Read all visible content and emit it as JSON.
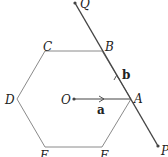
{
  "diagram": {
    "type": "regular hexagon with vectors",
    "colors": {
      "background": "#ffffff",
      "hexagon": "#8a8a8a",
      "line": "#444444",
      "text": "#222222"
    },
    "hexagon": {
      "vertices": [
        {
          "label": "A",
          "x": 131,
          "y": 99
        },
        {
          "label": "B",
          "x": 102,
          "y": 51
        },
        {
          "label": "C",
          "x": 45,
          "y": 51
        },
        {
          "label": "D",
          "x": 17,
          "y": 99
        },
        {
          "label": "E",
          "x": 45,
          "y": 147
        },
        {
          "label": "F",
          "x": 102,
          "y": 147
        }
      ]
    },
    "center": {
      "label": "O",
      "x": 74,
      "y": 99
    },
    "vectors": [
      {
        "label": "a",
        "from": "O",
        "to": "A"
      },
      {
        "label": "b",
        "from": "A",
        "to": "B",
        "along": "line PQ"
      }
    ],
    "line": {
      "endpoints": [
        {
          "label": "Q",
          "x": 75,
          "y": 3
        },
        {
          "label": "P",
          "x": 158,
          "y": 146
        }
      ]
    },
    "labels": {
      "A": "A",
      "B": "B",
      "C": "C",
      "D": "D",
      "E": "E",
      "F": "F",
      "O": "O",
      "Q": "Q",
      "P": "P",
      "a": "a",
      "b": "b"
    }
  }
}
